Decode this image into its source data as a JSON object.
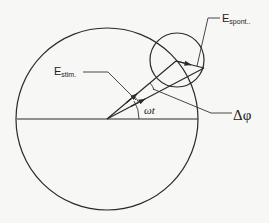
{
  "diagram": {
    "type": "phasor-diagram",
    "colors": {
      "stroke": "#2a2a2a",
      "background": "#f7f7f5"
    },
    "labels": {
      "e_stim": {
        "main": "E",
        "sub": "stim."
      },
      "e_spont": {
        "main": "E",
        "sub": "spont.."
      },
      "omega_t": "ωt",
      "delta_phi": "Δφ"
    },
    "geometry": {
      "large_circle": {
        "cx": 107,
        "cy": 119,
        "r": 91
      },
      "small_circle": {
        "cx": 177,
        "cy": 60,
        "r": 27
      },
      "origin": [
        107,
        119
      ],
      "stim_tip": [
        176,
        61
      ],
      "resultant_tip": [
        204,
        68
      ]
    }
  }
}
